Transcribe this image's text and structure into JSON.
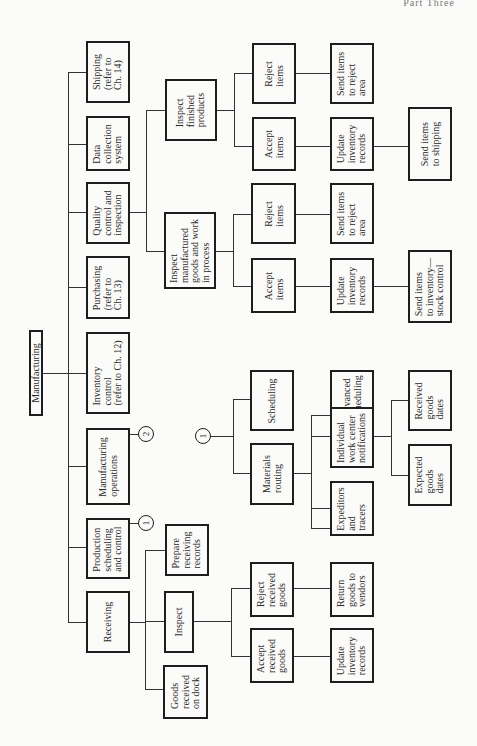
{
  "page_header": "Part Three",
  "root": {
    "label": "Manufacturing"
  },
  "level1": [
    {
      "id": "shipping",
      "label": "Shipping\n(refer to\nCh. 14)"
    },
    {
      "id": "data-collection",
      "label": "Data\ncollection\nsystem"
    },
    {
      "id": "quality-control",
      "label": "Quality\ncontrol and\ninspection"
    },
    {
      "id": "purchasing",
      "label": "Purchasing\n(refer to\nCh. 13)"
    },
    {
      "id": "inventory-control",
      "label": "Inventory\ncontrol\n(refer to Ch. 12)"
    },
    {
      "id": "manufacturing-operations",
      "label": "Manufacturing\noperations"
    },
    {
      "id": "production-scheduling",
      "label": "Production\nscheduling\nand control"
    },
    {
      "id": "receiving",
      "label": "Receiving"
    }
  ],
  "connectors": {
    "one": "1",
    "two": "2"
  },
  "quality": {
    "inspect_finished": "Inspect\nfinished\nproducts",
    "inspect_manufactured": "Inspect\nmanufactured\ngoods and work\nin process",
    "finished": {
      "reject": "Reject\nitems",
      "accept": "Accept\nitems",
      "send_reject": "Send items\nto reject\narea",
      "update_inventory": "Update\ninventory\nrecords",
      "send_shipping": "Send items\nto shipping"
    },
    "wip": {
      "reject": "Reject\nitems",
      "accept": "Accept\nitems",
      "send_reject": "Send items\nto reject\narea",
      "update_inventory": "Update\ninventory\nrecords",
      "send_inventory": "Send items\nto inventory—\nstock control"
    }
  },
  "scheduling": {
    "scheduling": "Scheduling",
    "materials_routing": "Materials\nrouting",
    "advanced_scheduling": "Advanced\nscheduling",
    "individual_work_center": "Individual\nwork center\nnotifications",
    "expeditors": "Expeditors\nand\ntracers",
    "received_goods_dates": "Received\ngoods\ndates",
    "expected_goods_dates": "Expected\ngoods\ndates"
  },
  "receiving": {
    "prepare_records": "Prepare\nreceiving\nrecords",
    "inspect": "Inspect",
    "goods_on_dock": "Goods\nreceived\non dock",
    "reject_goods": "Reject\nreceived\ngoods",
    "accept_goods": "Accept\nreceived\ngoods",
    "return_goods": "Return\ngoods to\nvendors",
    "update_inventory": "Update\ninventory\nrecords"
  }
}
